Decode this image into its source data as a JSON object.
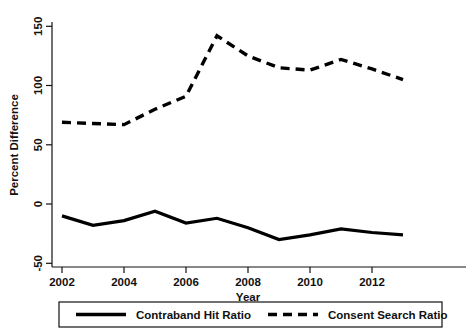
{
  "chart_data": {
    "type": "line",
    "title": "",
    "subtitle": "",
    "xlabel": "Year",
    "ylabel": "Percent Difference",
    "x": [
      2002,
      2003,
      2004,
      2005,
      2006,
      2007,
      2008,
      2009,
      2010,
      2011,
      2012,
      2013
    ],
    "xlim": [
      2002,
      2013
    ],
    "ylim": [
      -50,
      150
    ],
    "xticks": [
      2002,
      2004,
      2006,
      2008,
      2010,
      2012
    ],
    "xtick_labels": [
      "2002",
      "2004",
      "2006",
      "2008",
      "2010",
      "2012"
    ],
    "yticks": [
      -50,
      0,
      50,
      100,
      150
    ],
    "ytick_labels": [
      "-50",
      "0",
      "50",
      "100",
      "150"
    ],
    "grid": false,
    "legend_position": "bottom",
    "series": [
      {
        "name": "Contraband Hit Ratio",
        "style": "solid",
        "color": "#000000",
        "values": [
          -10,
          -18,
          -14,
          -6,
          -16,
          -12,
          -20,
          -30,
          -26,
          -21,
          -24,
          -26
        ]
      },
      {
        "name": "Consent Search Ratio",
        "style": "dashed",
        "color": "#000000",
        "values": [
          69,
          68,
          67,
          80,
          91,
          142,
          125,
          115,
          113,
          122,
          114,
          105
        ]
      }
    ]
  },
  "axes": {
    "y_label": "Percent Difference",
    "x_label": "Year"
  },
  "legend": {
    "items": [
      {
        "label": "Contraband Hit Ratio",
        "style": "solid"
      },
      {
        "label": "Consent Search Ratio",
        "style": "dashed"
      }
    ]
  },
  "ticks": {
    "y": [
      "150",
      "100",
      "50",
      "0",
      "-50"
    ],
    "x": [
      "2002",
      "2004",
      "2006",
      "2008",
      "2010",
      "2012"
    ]
  }
}
